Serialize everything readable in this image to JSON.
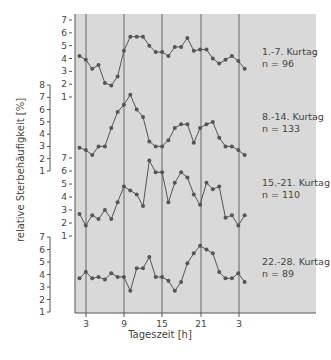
{
  "chart_data": {
    "type": "line",
    "xlabel": "Tageszeit [h]",
    "ylabel": "relative Sterbehäufigkeit [%]",
    "x_ticks": [
      "3",
      "9",
      "15",
      "21",
      "3"
    ],
    "x_hours": [
      2,
      3,
      4,
      5,
      6,
      7,
      8,
      9,
      10,
      11,
      12,
      13,
      14,
      15,
      16,
      17,
      18,
      19,
      20,
      21,
      22,
      23,
      24,
      1,
      2,
      3,
      4
    ],
    "grid": "vertical lines at 3, 9, 15, 21, 3 h",
    "series": [
      {
        "name": "1.-7. Kurtag",
        "n_label": "n = 96",
        "y_ticks": [
          1,
          2,
          3,
          4,
          5,
          6,
          7
        ],
        "values": [
          4.2,
          3.9,
          3.2,
          3.5,
          2.1,
          1.9,
          2.6,
          4.6,
          5.7,
          5.7,
          5.7,
          5.0,
          4.5,
          4.5,
          4.2,
          4.9,
          4.9,
          5.6,
          4.6,
          4.7,
          4.7,
          4.0,
          3.6,
          3.9,
          4.2,
          3.8,
          3.2
        ]
      },
      {
        "name": "8.-14. Kurtag",
        "n_label": "n = 133",
        "y_ticks": [
          1,
          2,
          3,
          4,
          5,
          6,
          7,
          8
        ],
        "values": [
          2.9,
          2.7,
          2.3,
          3.0,
          3.0,
          4.5,
          5.8,
          6.4,
          7.2,
          6.0,
          5.4,
          3.4,
          3.0,
          3.0,
          3.5,
          4.5,
          4.8,
          4.8,
          3.3,
          4.5,
          4.8,
          5.0,
          3.7,
          3.0,
          3.0,
          2.7,
          2.3
        ]
      },
      {
        "name": "15.-21. Kurtag",
        "n_label": "n = 110",
        "y_ticks": [
          1,
          2,
          3,
          4,
          5,
          6,
          7
        ],
        "values": [
          2.7,
          1.8,
          2.6,
          2.3,
          3.0,
          2.3,
          3.6,
          4.8,
          4.5,
          4.2,
          3.3,
          6.8,
          5.9,
          5.9,
          3.6,
          5.1,
          5.9,
          5.5,
          4.2,
          3.4,
          5.1,
          4.6,
          4.8,
          2.4,
          2.6,
          1.8,
          2.6
        ]
      },
      {
        "name": "22.-28. Kurtag",
        "n_label": "n = 89",
        "y_ticks": [
          1,
          2,
          3,
          4,
          5,
          6,
          7
        ],
        "values": [
          3.7,
          4.2,
          3.7,
          3.8,
          3.6,
          4.1,
          3.8,
          3.8,
          2.7,
          4.5,
          4.5,
          5.4,
          3.8,
          3.8,
          3.5,
          2.7,
          3.4,
          4.9,
          5.7,
          6.3,
          6.0,
          5.7,
          4.2,
          3.7,
          3.7,
          4.1,
          3.4
        ]
      }
    ],
    "colors": {
      "background": "#d9d9d9",
      "line": "#555555",
      "marker": "#555555",
      "grid": "#666666"
    }
  },
  "labels": {
    "xlabel": "Tageszeit [h]",
    "ylabel": "relative Sterbehäufigkeit [%]"
  }
}
